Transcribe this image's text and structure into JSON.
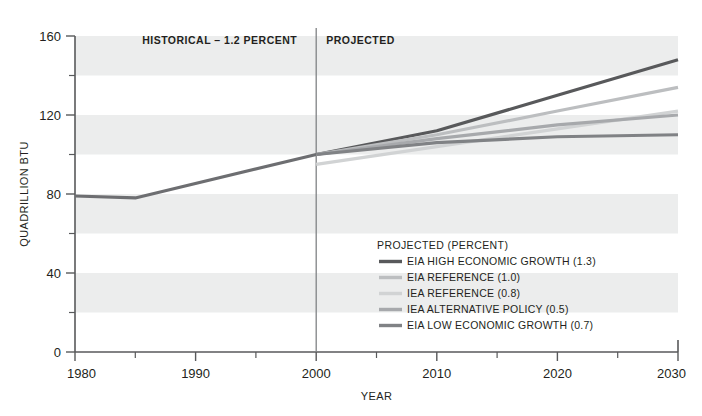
{
  "chart_data": {
    "type": "line",
    "title": "",
    "xlabel": "YEAR",
    "ylabel": "QUADRILLION BTU",
    "xlim": [
      1980,
      2030
    ],
    "ylim": [
      0,
      160
    ],
    "grid": "horizontal-bands",
    "legend_position": "inside-lower-right",
    "x_ticks": [
      1980,
      1990,
      2000,
      2010,
      2020,
      2030
    ],
    "x_tick_labels": [
      "1980",
      "1990",
      "2000",
      "2010",
      "2020",
      "2030"
    ],
    "x_minor_ticks": [
      1985,
      1995,
      2005,
      2015,
      2025
    ],
    "y_ticks": [
      0,
      40,
      80,
      120,
      160
    ],
    "y_tick_labels": [
      "0",
      "40",
      "80",
      "120",
      "160"
    ],
    "y_minor_ticks": [
      20,
      60,
      100,
      140
    ],
    "divider_x": 2000,
    "annotations": [
      {
        "text": "HISTORICAL – 1.2 PERCENT",
        "x": 1992,
        "y": 156
      },
      {
        "text": "PROJECTED",
        "x": 2005,
        "y": 156
      }
    ],
    "legend_title": "PROJECTED (PERCENT)",
    "series": [
      {
        "name": "HISTORICAL",
        "color": "#6d6e71",
        "width": 3.2,
        "in_legend": false,
        "x": [
          1980,
          1985,
          2000
        ],
        "values": [
          79,
          78,
          100
        ]
      },
      {
        "name": "EIA HIGH ECONOMIC GROWTH (1.3)",
        "color": "#58595b",
        "width": 3.2,
        "in_legend": true,
        "x": [
          2000,
          2010,
          2020,
          2030
        ],
        "values": [
          100,
          112,
          130,
          148
        ]
      },
      {
        "name": "EIA REFERENCE (1.0)",
        "color": "#bcbec0",
        "width": 3.2,
        "in_legend": true,
        "x": [
          2000,
          2010,
          2020,
          2030
        ],
        "values": [
          100,
          110,
          122,
          134
        ]
      },
      {
        "name": "IEA REFERENCE (0.8)",
        "color": "#d1d3d4",
        "width": 3.2,
        "in_legend": true,
        "x": [
          2000,
          2010,
          2020,
          2030
        ],
        "values": [
          95,
          104,
          113,
          122
        ]
      },
      {
        "name": "IEA ALTERNATIVE POLICY (0.5)",
        "color": "#a7a9ac",
        "width": 3.2,
        "in_legend": true,
        "x": [
          2000,
          2010,
          2020,
          2030
        ],
        "values": [
          100,
          108,
          115,
          120
        ]
      },
      {
        "name": "EIA LOW ECONOMIC GROWTH (0.7)",
        "color": "#808285",
        "width": 3.2,
        "in_legend": true,
        "x": [
          2000,
          2010,
          2020,
          2030
        ],
        "values": [
          100,
          106,
          109,
          110
        ]
      }
    ]
  },
  "style": {
    "band_color": "#eceded",
    "axis_color": "#58595b",
    "divider_color": "#808285",
    "background": "#ffffff"
  }
}
